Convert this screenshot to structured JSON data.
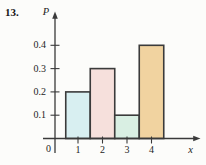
{
  "problem_number": "13.",
  "chart_data": {
    "type": "bar",
    "title": "",
    "xlabel": "x",
    "ylabel": "P",
    "origin_label": "0",
    "categories": [
      "1",
      "2",
      "3",
      "4"
    ],
    "values": [
      0.2,
      0.3,
      0.1,
      0.4
    ],
    "y_ticks": [
      "0.1",
      "0.2",
      "0.3",
      "0.4"
    ],
    "ylim": [
      0,
      0.45
    ],
    "xlim": [
      0,
      5
    ],
    "grid": false,
    "legend": false,
    "bar_colors": [
      "#d8eff1",
      "#f6e0dc",
      "#d9efe3",
      "#f1d3a0"
    ],
    "bar_outline_color": "#3b3b3b",
    "axis_color": "#3a3a3a"
  }
}
